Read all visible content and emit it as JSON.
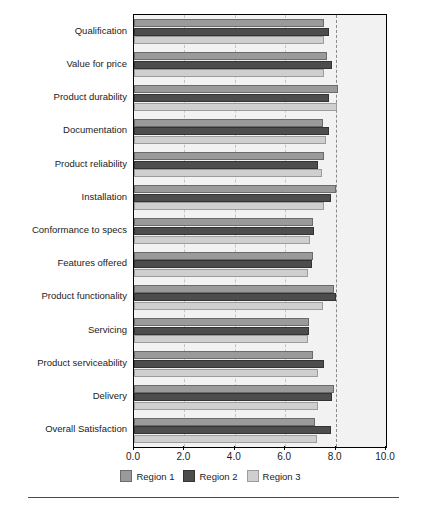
{
  "chart_data": {
    "type": "bar",
    "orientation": "horizontal",
    "title": "",
    "subtitle": "",
    "xlabel": "",
    "ylabel": "",
    "xlim": [
      0.0,
      10.0
    ],
    "xticks": [
      0.0,
      2.0,
      4.0,
      6.0,
      8.0,
      10.0
    ],
    "xtick_labels": [
      "0.0",
      "2.0",
      "4.0",
      "6.0",
      "8.0",
      "10.0"
    ],
    "grid": true,
    "gridlines_at": [
      2.0,
      4.0,
      6.0
    ],
    "reference_line": 8.0,
    "legend_position": "bottom",
    "categories": [
      "Qualification",
      "Value for price",
      "Product durability",
      "Documentation",
      "Product reliability",
      "Installation",
      "Conformance to specs",
      "Features offered",
      "Product functionality",
      "Servicing",
      "Product serviceability",
      "Delivery",
      "Overall Satisfaction"
    ],
    "series": [
      {
        "name": "Region 1",
        "color": "#9a9a9a",
        "values": [
          7.55,
          7.65,
          8.1,
          7.5,
          7.55,
          8.0,
          7.1,
          7.1,
          7.95,
          6.95,
          7.1,
          7.95,
          7.2
        ]
      },
      {
        "name": "Region 2",
        "color": "#4d4d4d",
        "values": [
          7.75,
          7.85,
          7.75,
          7.75,
          7.3,
          7.8,
          7.15,
          7.05,
          8.0,
          6.95,
          7.55,
          7.85,
          7.8
        ]
      },
      {
        "name": "Region 3",
        "color": "#cfcfcf",
        "values": [
          7.55,
          7.55,
          8.05,
          7.6,
          7.45,
          7.55,
          7.0,
          6.9,
          7.5,
          6.9,
          7.3,
          7.3,
          7.25
        ]
      }
    ]
  },
  "legend": {
    "items": [
      {
        "label": "Region 1",
        "swatch": "s0"
      },
      {
        "label": "Region 2",
        "swatch": "s1"
      },
      {
        "label": "Region 3",
        "swatch": "s2"
      }
    ]
  },
  "colors": {
    "region_1": "#9a9a9a",
    "region_2": "#4d4d4d",
    "region_3": "#cfcfcf",
    "plot_background": "#f2f2f2",
    "axis": "#000000",
    "gridline": "#c4c4c4",
    "reference_line": "#8a8a8a"
  }
}
